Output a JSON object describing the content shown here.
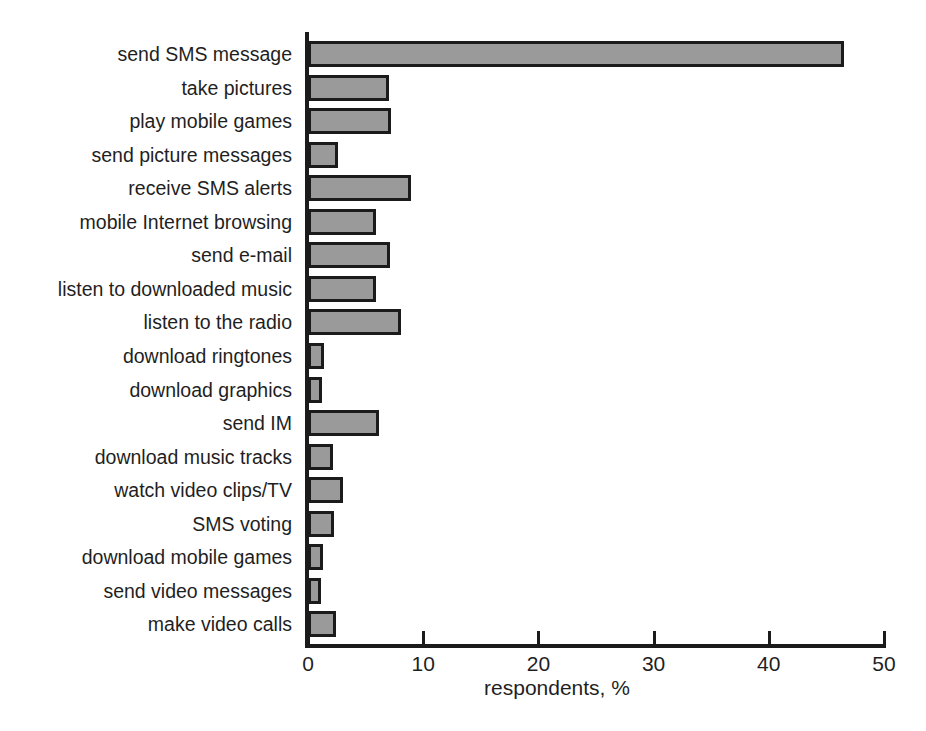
{
  "clipped_title_fragment": "",
  "chart_data": {
    "type": "bar",
    "orientation": "horizontal",
    "title": "",
    "xlabel": "respondents, %",
    "ylabel": "",
    "xlim": [
      0,
      50
    ],
    "xticks": [
      0,
      10,
      20,
      30,
      40,
      50
    ],
    "xtick_labels": [
      "0",
      "10",
      "20",
      "30",
      "40",
      "50"
    ],
    "grid": false,
    "legend": null,
    "bar_fill_color": "#9a9a9a",
    "bar_edge_color": "#1b1b1b",
    "categories": [
      "send SMS message",
      "take pictures",
      "play mobile games",
      "send picture messages",
      "receive SMS alerts",
      "mobile Internet browsing",
      "send e-mail",
      "listen to downloaded music",
      "listen to the radio",
      "download ringtones",
      "download graphics",
      "send IM",
      "download music tracks",
      "watch video clips/TV",
      "SMS voting",
      "download mobile games",
      "send video messages",
      "make video calls"
    ],
    "values": [
      46.5,
      7.0,
      7.2,
      2.6,
      8.9,
      5.9,
      7.1,
      5.9,
      8.1,
      1.4,
      1.2,
      6.2,
      2.2,
      3.0,
      2.3,
      1.3,
      1.1,
      2.4
    ]
  }
}
